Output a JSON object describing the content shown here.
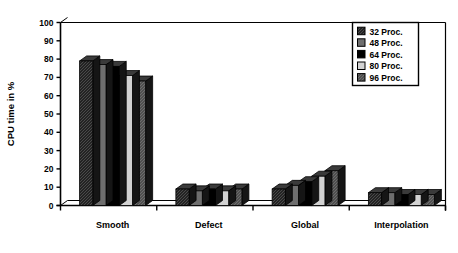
{
  "chart_data": {
    "type": "bar",
    "title": "",
    "xlabel": "",
    "ylabel": "CPU time in %",
    "ylim": [
      0,
      100
    ],
    "ytick_step": 10,
    "yticks": [
      "0",
      "10",
      "20",
      "30",
      "40",
      "50",
      "60",
      "70",
      "80",
      "90",
      "100"
    ],
    "grid": false,
    "legend_position": "top-right",
    "categories": [
      "Smooth",
      "Defect",
      "Global",
      "Interpolation"
    ],
    "series": [
      {
        "name": "32 Proc.",
        "color": "#2e2e2e",
        "values": [
          79,
          9,
          9,
          7
        ]
      },
      {
        "name": "48 Proc.",
        "color": "#6e6e6e",
        "values": [
          77,
          8,
          11,
          7
        ]
      },
      {
        "name": "64 Proc.",
        "color": "#000000",
        "values": [
          76,
          9,
          13,
          6
        ]
      },
      {
        "name": "80 Proc.",
        "color": "#d2d2d2",
        "values": [
          71,
          8,
          16,
          6
        ]
      },
      {
        "name": "96 Proc.",
        "color": "#5a5a5a",
        "values": [
          68,
          9,
          19,
          6
        ]
      }
    ]
  },
  "legend": {
    "entries": [
      {
        "label": "32 Proc."
      },
      {
        "label": "48 Proc."
      },
      {
        "label": "64 Proc."
      },
      {
        "label": "80 Proc."
      },
      {
        "label": "96 Proc."
      }
    ]
  },
  "axes": {
    "y_title": "CPU time in %",
    "y_ticks": [
      "100",
      "90",
      "80",
      "70",
      "60",
      "50",
      "40",
      "30",
      "20",
      "10",
      "0"
    ],
    "x_ticks": [
      "Smooth",
      "Defect",
      "Global",
      "Interpolation"
    ]
  }
}
